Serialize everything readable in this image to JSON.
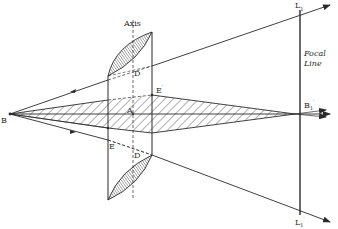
{
  "figure": {
    "colors": {
      "ink": "#2a2a2a",
      "hatch": "#3a3a3a",
      "background": "#ffffff"
    }
  },
  "labels": {
    "axis": "Axis",
    "source_point": "B",
    "center": "A",
    "point_D_top": "D",
    "point_D_bottom": "D",
    "point_D_bottom_prime": "′",
    "point_E_left": "E",
    "point_E_right": "E",
    "point_E_right_prime": "′",
    "focal_point": "B",
    "focal_point_sub": "1",
    "focal_point_sup": "′",
    "focal_line_word1": "Focal",
    "focal_line_word2": "Line",
    "line_top_end": "L",
    "line_top_end_sub": "1",
    "line_bottom_end": "L",
    "line_bottom_end_sub": "1",
    "line_bottom_end_prime": "′"
  }
}
